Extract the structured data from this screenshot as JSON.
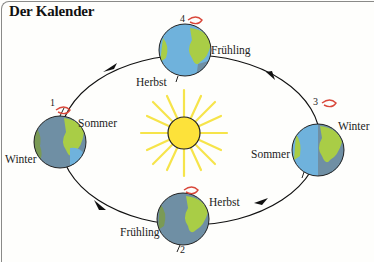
{
  "title": "Der Kalender",
  "colors": {
    "orbit": "#111111",
    "sun_core": "#fde23a",
    "sun_rays": "#f6e44a",
    "ocean": "#6fb2dc",
    "ocean_shadow": "#6f8fa4",
    "land": "#a9cd46",
    "land_shadow": "#7a9a55",
    "rotation_arrow": "#d9473a"
  },
  "positions": [
    {
      "number": "1",
      "labels": {
        "top": "Sommer",
        "bottom": "Winter"
      }
    },
    {
      "number": "2",
      "labels": {
        "top": "Herbst",
        "bottom": "Frühling"
      }
    },
    {
      "number": "3",
      "labels": {
        "top": "Winter",
        "bottom": "Sommer"
      }
    },
    {
      "number": "4",
      "labels": {
        "top": "Frühling",
        "bottom": "Herbst"
      }
    }
  ]
}
